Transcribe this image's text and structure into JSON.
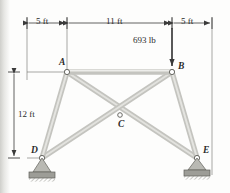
{
  "figure": {
    "units": "ft",
    "colors": {
      "member_fill": "#c9c9c4",
      "member_edge": "#8d8d87",
      "line": "#3a3a3a",
      "text": "#2b2b2b",
      "support_hatch": "#7d7d77"
    }
  },
  "dimensions": {
    "top": [
      {
        "label": "5 ft",
        "value": 5
      },
      {
        "label": "11 ft",
        "value": 11
      },
      {
        "label": "5 ft",
        "value": 5
      }
    ],
    "left": [
      {
        "label": "12 ft",
        "value": 12
      }
    ]
  },
  "load": {
    "label": "693 lb",
    "magnitude": 693,
    "unit": "lb",
    "direction": "down",
    "applied_at": "B"
  },
  "joints": [
    {
      "id": "A",
      "label": "A",
      "x": 67,
      "y": 72,
      "support": "none"
    },
    {
      "id": "B",
      "label": "B",
      "x": 172,
      "y": 72,
      "support": "none"
    },
    {
      "id": "C",
      "label": "C",
      "x": 120,
      "y": 115,
      "support": "none"
    },
    {
      "id": "D",
      "label": "D",
      "x": 42,
      "y": 158,
      "support": "pin"
    },
    {
      "id": "E",
      "label": "E",
      "x": 197,
      "y": 158,
      "support": "pin"
    }
  ],
  "members": [
    {
      "from": "A",
      "to": "B"
    },
    {
      "from": "A",
      "to": "D"
    },
    {
      "from": "A",
      "to": "E"
    },
    {
      "from": "B",
      "to": "D"
    },
    {
      "from": "B",
      "to": "E"
    }
  ]
}
